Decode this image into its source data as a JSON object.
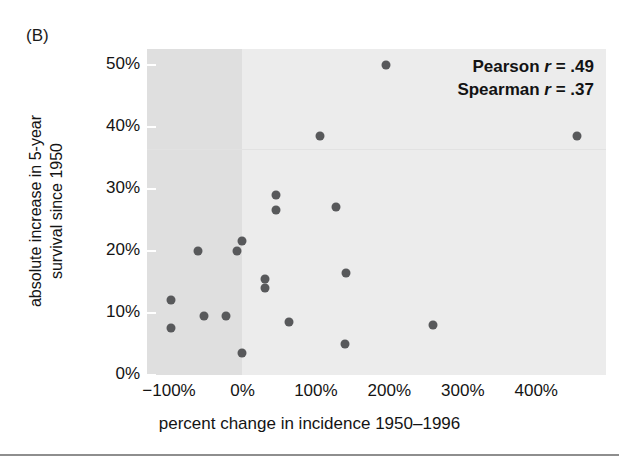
{
  "figure": {
    "panel_label": "(B)",
    "annotation": {
      "pearson_label": "Pearson",
      "pearson_symbol": "r",
      "pearson_eq": "=",
      "pearson_value": ".49",
      "spearman_label": "Spearman",
      "spearman_symbol": "r",
      "spearman_eq": "=",
      "spearman_value": ".37"
    },
    "colors": {
      "point": "#58595b",
      "plot_background": "#ececec",
      "shaded_background": "#dfdfdf",
      "text": "#141414",
      "rule": "#8e8e8e"
    }
  },
  "chart_data": {
    "type": "scatter",
    "title": "(B)",
    "xlabel": "percent change in incidence 1950–1996",
    "ylabel_line1": "absolute increase in 5-year",
    "ylabel_line2": "survival since 1950",
    "xlim": [
      -130,
      495
    ],
    "ylim": [
      0,
      52.5
    ],
    "xticks": [
      -100,
      0,
      100,
      200,
      300,
      400
    ],
    "xtick_labels": [
      "−100%",
      "0%",
      "100%",
      "200%",
      "300%",
      "400%"
    ],
    "yticks": [
      0,
      10,
      20,
      30,
      40,
      50
    ],
    "ytick_labels": [
      "0%",
      "10%",
      "20%",
      "30%",
      "40%",
      "50%"
    ],
    "grid": false,
    "legend": "none",
    "annotations": [
      "Pearson r = .49",
      "Spearman r = .37"
    ],
    "shaded_region": {
      "xmin": -130,
      "xmax": 0,
      "note": "light grey band left of 0%"
    },
    "points": [
      {
        "x": 195,
        "y": 50.0
      },
      {
        "x": 105,
        "y": 38.5
      },
      {
        "x": 455,
        "y": 38.5
      },
      {
        "x": 45,
        "y": 29.0
      },
      {
        "x": 127,
        "y": 27.0
      },
      {
        "x": 46,
        "y": 26.5
      },
      {
        "x": 0,
        "y": 21.5
      },
      {
        "x": -7,
        "y": 20.0
      },
      {
        "x": -61,
        "y": 20.0
      },
      {
        "x": 141,
        "y": 16.5
      },
      {
        "x": 31,
        "y": 15.5
      },
      {
        "x": 31,
        "y": 14.0
      },
      {
        "x": -97,
        "y": 12.0
      },
      {
        "x": -22,
        "y": 9.5
      },
      {
        "x": -53,
        "y": 9.5
      },
      {
        "x": 64,
        "y": 8.5
      },
      {
        "x": 260,
        "y": 8.0
      },
      {
        "x": -97,
        "y": 7.5
      },
      {
        "x": 139,
        "y": 5.0
      },
      {
        "x": 0,
        "y": 3.5
      }
    ]
  }
}
